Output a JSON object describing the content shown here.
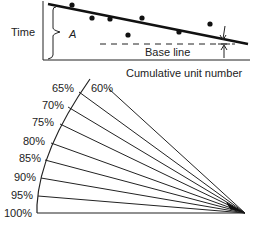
{
  "learning_curve": {
    "y_label": "Time",
    "x_label": "Cumulative unit number",
    "brace_label": "A",
    "baseline_label": "Base line",
    "data_points": [
      {
        "x": 72,
        "y": 5
      },
      {
        "x": 92,
        "y": 18
      },
      {
        "x": 110,
        "y": 19
      },
      {
        "x": 142,
        "y": 18
      },
      {
        "x": 128,
        "y": 35
      },
      {
        "x": 179,
        "y": 32
      },
      {
        "x": 210,
        "y": 24
      }
    ]
  },
  "fan": {
    "labels": [
      "60%",
      "65%",
      "70%",
      "75%",
      "80%",
      "85%",
      "90%",
      "95%",
      "100%"
    ]
  }
}
